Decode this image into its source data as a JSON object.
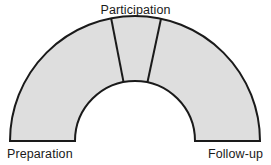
{
  "diagram": {
    "type": "semicircular-arch",
    "labels": {
      "top": "Participation",
      "bottom_left": "Preparation",
      "bottom_right": "Follow-up"
    },
    "style": {
      "fill": "#dedede",
      "stroke": "#1a1a1a",
      "stroke_width": 2,
      "background": "#ffffff",
      "text_color": "#1a1a1a"
    },
    "geometry": {
      "center_x": 135,
      "center_y": 141,
      "inner_radius": 60,
      "outer_radius": 125,
      "start_angle_deg": 180,
      "end_angle_deg": 0,
      "divider_angles_deg": [
        101,
        78
      ]
    },
    "segments": [
      {
        "name": "Preparation",
        "start_angle_deg": 180,
        "end_angle_deg": 101
      },
      {
        "name": "Participation",
        "start_angle_deg": 101,
        "end_angle_deg": 78
      },
      {
        "name": "Follow-up",
        "start_angle_deg": 78,
        "end_angle_deg": 0
      }
    ]
  }
}
